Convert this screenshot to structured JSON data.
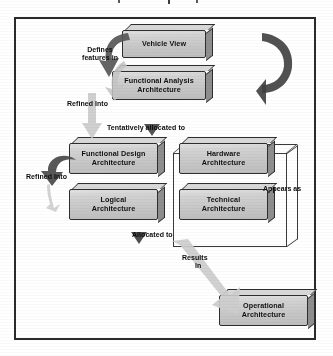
{
  "diagram": {
    "title_fragment_visible": false,
    "frame": {
      "border_color": "#2b2b2b",
      "background": "#ffffff"
    },
    "palette": {
      "box_fill": "#cfcfcf",
      "box_border": "#2e2e2e",
      "box_side_shadow": "#8e8e8e",
      "text": "#111111",
      "arrow_dark": "#4f4f4f",
      "arrow_light": "#c9c9c9"
    },
    "nodes": [
      {
        "id": "vehicle-view",
        "label": "Vehicle View",
        "lines": [
          "Vehicle View"
        ]
      },
      {
        "id": "functional-analysis",
        "label": "Functional Analysis Architecture",
        "lines": [
          "Functional Analysis",
          "Architecture"
        ]
      },
      {
        "id": "functional-design",
        "label": "Functional Design Architecture",
        "lines": [
          "Functional Design",
          "Architecture"
        ]
      },
      {
        "id": "hardware-architecture",
        "label": "Hardware Architecture",
        "lines": [
          "Hardware",
          "Architecture"
        ]
      },
      {
        "id": "logical-architecture",
        "label": "Logical Architecture",
        "lines": [
          "Logical",
          "Architecture"
        ]
      },
      {
        "id": "technical-architecture",
        "label": "Technical Architecture",
        "lines": [
          "Technical",
          "Architecture"
        ]
      },
      {
        "id": "operational-architecture",
        "label": "Operational Architecture",
        "lines": [
          "Operational",
          "Architecture"
        ]
      }
    ],
    "connectors": [
      {
        "id": "defines-features-in",
        "label": "Defines features in",
        "lines": [
          "Defines",
          "features in"
        ],
        "from": "vehicle-view",
        "to": "functional-analysis",
        "arrow_style": "curved-dark-down"
      },
      {
        "id": "refined-into-top",
        "label": "Refined Into",
        "lines": [
          "Refined Into"
        ],
        "from": "functional-analysis",
        "to": "functional-design",
        "arrow_style": "straight-light-down"
      },
      {
        "id": "tentatively-allocated",
        "label": "Tentatively allocated to",
        "lines": [
          "Tentatively allocated to"
        ],
        "from": "functional-design",
        "to": "hardware-architecture",
        "arrow_style": "small-dark-right"
      },
      {
        "id": "refined-into-left",
        "label": "Refined Into",
        "lines": [
          "Refined Into"
        ],
        "from": "functional-design",
        "to": "logical-architecture",
        "arrow_style": "curved-hook-down"
      },
      {
        "id": "appears-as",
        "label": "Appears as",
        "lines": [
          "Appears as"
        ],
        "from": "hardware-architecture",
        "to": "technical-architecture",
        "arrow_style": "curved-dark-right"
      },
      {
        "id": "allocated-to",
        "label": "Allocated to",
        "lines": [
          "Allocated to"
        ],
        "from": "logical-architecture",
        "to": "technical-architecture",
        "arrow_style": "small-dark-right"
      },
      {
        "id": "results-in",
        "label": "Results In",
        "lines": [
          "Results",
          "In"
        ],
        "from": "technical-architecture",
        "to": "operational-architecture",
        "arrow_style": "diagonal-light-down-right"
      }
    ]
  }
}
